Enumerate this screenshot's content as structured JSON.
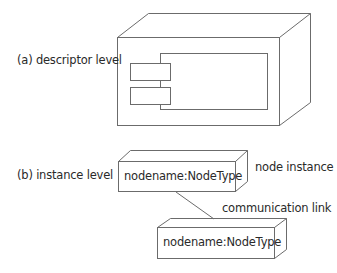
{
  "diagram": {
    "type": "UML deployment diagram — node notation",
    "stroke_color": "#6b6b6b",
    "text_color": "#2a2a2a",
    "sections": [
      {
        "label": "(a) descriptor level",
        "elements": [
          {
            "kind": "node",
            "name": "descriptor node (3D box)",
            "contains": "component icon"
          }
        ]
      },
      {
        "label": "(b) instance level",
        "elements": [
          {
            "kind": "node-instance",
            "text": "nodename:NodeType"
          },
          {
            "kind": "node-instance",
            "text": "nodename:NodeType"
          }
        ],
        "annotations": {
          "node_instance": "node instance",
          "communication_link": "communication link"
        }
      }
    ]
  }
}
